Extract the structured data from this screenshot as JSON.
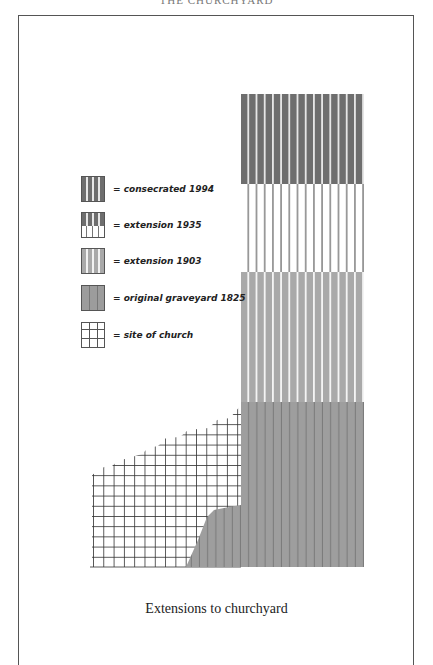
{
  "page": {
    "header_fragment": "THE CHURCHYARD",
    "caption": "Extensions to churchyard"
  },
  "legend": {
    "items": [
      {
        "id": "consecrated-1994",
        "label": "= consecrated 1994",
        "color": "#6e6e6e"
      },
      {
        "id": "extension-1935",
        "label": "= extension 1935",
        "color": "#ffffff"
      },
      {
        "id": "extension-1903",
        "label": "= extension 1903",
        "color": "#a9a9a9"
      },
      {
        "id": "original-1825",
        "label": "= original graveyard 1825",
        "color": "#9c9c9c"
      },
      {
        "id": "site-of-church",
        "label": "= site of church",
        "color": "#ffffff"
      }
    ]
  },
  "map": {
    "regions": [
      {
        "name": "consecrated 1994",
        "x": 241,
        "y": 94,
        "width": 123,
        "height": 88
      },
      {
        "name": "extension 1935",
        "x": 241,
        "y": 182,
        "width": 123,
        "height": 90
      },
      {
        "name": "extension 1903",
        "x": 241,
        "y": 272,
        "width": 123,
        "height": 130
      },
      {
        "name": "original graveyard 1825",
        "x": 241,
        "y": 402,
        "width": 123,
        "height": 165
      },
      {
        "name": "site of church",
        "x": 92,
        "y": 405,
        "width": 150,
        "height": 162
      }
    ]
  }
}
